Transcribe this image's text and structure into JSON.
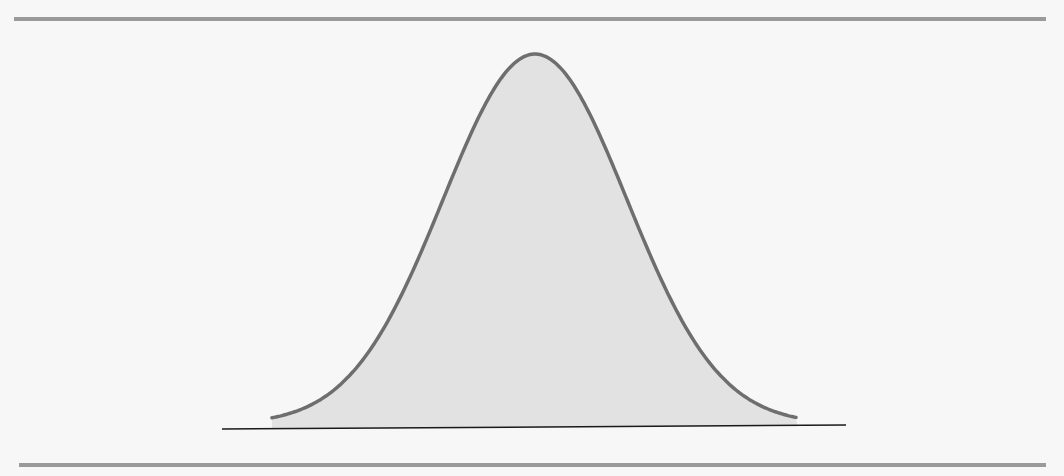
{
  "figure": {
    "colors": {
      "background": "#f7f7f7",
      "rule": "#9a9a9a",
      "curve_stroke": "#6e6e6e",
      "curve_fill": "#e2e2e2",
      "baseline": "#1a1a1a"
    },
    "curve": {
      "type": "gaussian",
      "center_x": 535,
      "peak_y": 54,
      "base_y": 424,
      "sigma_px": 92,
      "x_start": 272,
      "x_end": 797
    },
    "baseline": {
      "x1": 222,
      "y1": 429,
      "x2": 846,
      "y2": 425
    },
    "top_rule": {
      "x1": 14,
      "x2": 1046,
      "y": 19
    },
    "bottom_rule": {
      "x1": 19,
      "x2": 1046,
      "y": 465
    }
  }
}
